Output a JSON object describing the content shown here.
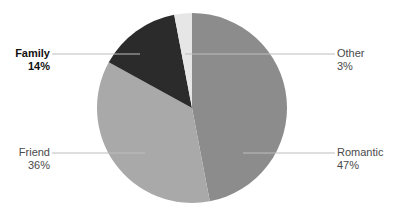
{
  "chart_data": {
    "type": "pie",
    "title": "",
    "start_angle_deg": 0,
    "direction": "clockwise",
    "slices": [
      {
        "label": "Romantic",
        "value": 47,
        "display": "47%",
        "color": "#8c8c8c",
        "highlighted": false
      },
      {
        "label": "Friend",
        "value": 36,
        "display": "36%",
        "color": "#a9a9a9",
        "highlighted": false
      },
      {
        "label": "Family",
        "value": 14,
        "display": "14%",
        "color": "#2b2b2b",
        "highlighted": true
      },
      {
        "label": "Other",
        "value": 3,
        "display": "3%",
        "color": "#e6e6e6",
        "highlighted": false
      }
    ],
    "categories": [
      "Romantic",
      "Friend",
      "Family",
      "Other"
    ],
    "values": [
      47,
      36,
      14,
      3
    ],
    "legend": "none (leader-line labels)"
  },
  "labels": {
    "romantic": {
      "name": "Romantic",
      "pct": "47%"
    },
    "friend": {
      "name": "Friend",
      "pct": "36%"
    },
    "family": {
      "name": "Family",
      "pct": "14%"
    },
    "other": {
      "name": "Other",
      "pct": "3%"
    }
  }
}
